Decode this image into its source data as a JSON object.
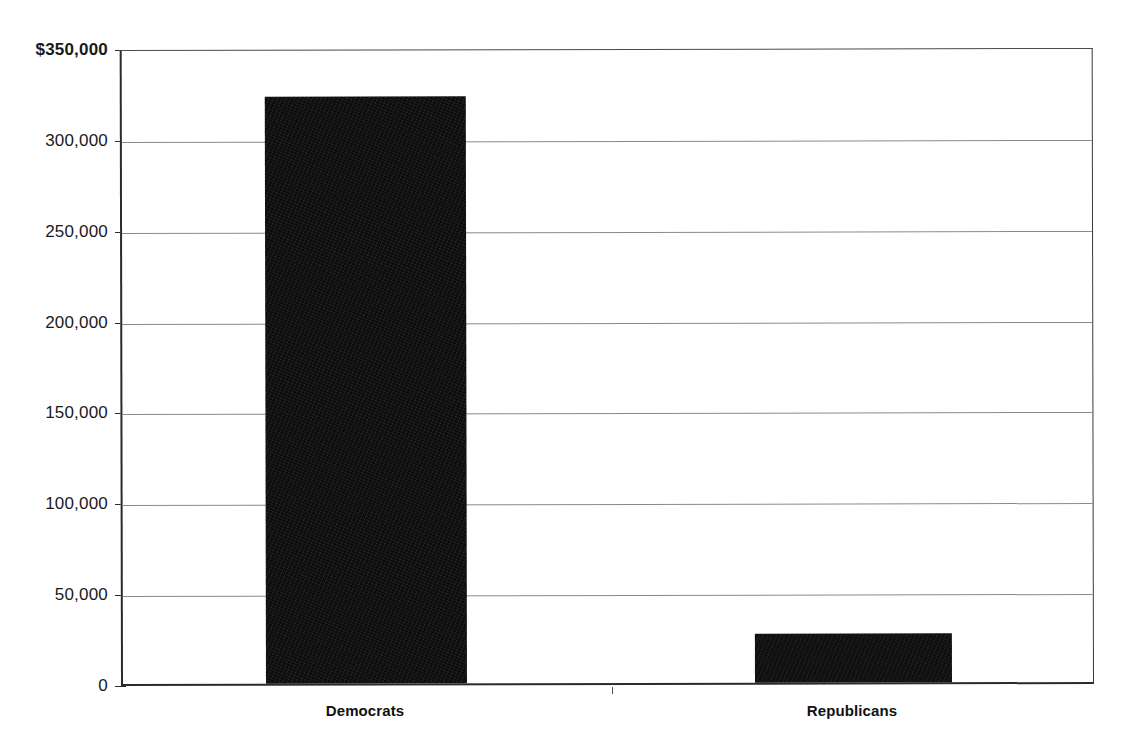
{
  "chart_data": {
    "type": "bar",
    "title": "",
    "subtitle": "",
    "xlabel": "",
    "ylabel": "",
    "categories": [
      "Democrats",
      "Republicans"
    ],
    "values": [
      323000,
      27000
    ],
    "series": [
      {
        "name": "Contributions",
        "values": [
          323000,
          27000
        ]
      }
    ],
    "ylim": [
      0,
      350000
    ],
    "ytick_values": [
      350000,
      300000,
      250000,
      200000,
      150000,
      100000,
      50000,
      0
    ],
    "ytick_labels": [
      "$350,000",
      "300,000",
      "250,000",
      "200,000",
      "150,000",
      "100,000",
      "50,000",
      "0"
    ],
    "grid": true,
    "grid_axis": "y",
    "legend": false,
    "legend_position": "none",
    "bar_color": "#0d0d0d",
    "grid_color": "#8a8a8a",
    "axis_color": "#2b2b2b",
    "background_color": "#ffffff",
    "annotations": []
  },
  "axes": {
    "y": {
      "ticks": [
        {
          "label": "$350,000",
          "value": 350000
        },
        {
          "label": "300,000",
          "value": 300000
        },
        {
          "label": "250,000",
          "value": 250000
        },
        {
          "label": "200,000",
          "value": 200000
        },
        {
          "label": "150,000",
          "value": 150000
        },
        {
          "label": "100,000",
          "value": 100000
        },
        {
          "label": "50,000",
          "value": 50000
        },
        {
          "label": "0",
          "value": 0
        }
      ]
    },
    "x": {
      "ticks": [
        {
          "label": "Democrats"
        },
        {
          "label": "Republicans"
        }
      ]
    }
  }
}
